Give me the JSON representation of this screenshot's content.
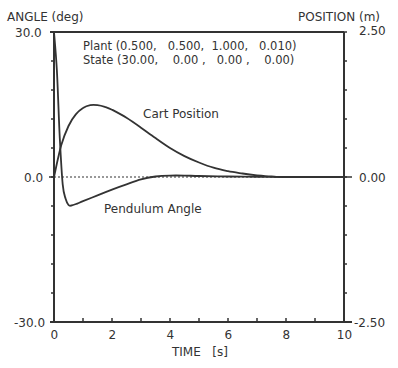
{
  "chart_data": {
    "type": "line",
    "title": "",
    "annotations": {
      "plant": "Plant (0.500,   0.500,  1.000,   0.010)",
      "state": "State (30.00,    0.00 ,   0.00 ,    0.00)"
    },
    "xlabel": "TIME   [s]",
    "ylabel_left": "ANGLE (deg)",
    "ylabel_right": "POSITION (m)",
    "xlim": [
      0,
      10
    ],
    "ylim_left": [
      -30.0,
      30.0
    ],
    "ylim_right": [
      -2.5,
      2.5
    ],
    "x_ticks": [
      "0",
      "2",
      "4",
      "6",
      "8",
      "10"
    ],
    "y_left_ticks": [
      "30.0",
      "0.0",
      "-30.0"
    ],
    "y_right_ticks": [
      "2.50",
      "0.00",
      "-2.50"
    ],
    "grid": false,
    "zero_line": "dotted",
    "series": [
      {
        "name": "Cart Position",
        "axis": "right",
        "x": [
          0,
          0.25,
          0.5,
          0.75,
          1.0,
          1.25,
          1.5,
          1.75,
          2.0,
          2.5,
          3.0,
          3.5,
          4.0,
          4.5,
          5.0,
          5.5,
          6.0,
          6.5,
          7.0,
          7.5,
          8.0,
          10.0
        ],
        "values": [
          0.0,
          0.55,
          0.88,
          1.08,
          1.19,
          1.24,
          1.24,
          1.21,
          1.16,
          1.02,
          0.85,
          0.67,
          0.5,
          0.36,
          0.25,
          0.16,
          0.1,
          0.06,
          0.03,
          0.01,
          0.0,
          0.0
        ]
      },
      {
        "name": "Pendulum Angle",
        "axis": "left",
        "x": [
          0,
          0.1,
          0.2,
          0.3,
          0.4,
          0.5,
          0.6,
          0.8,
          1.0,
          1.5,
          2.0,
          2.5,
          3.0,
          3.5,
          4.0,
          4.5,
          5.0,
          6.0,
          7.0,
          8.0,
          10.0
        ],
        "values": [
          30.0,
          22.0,
          8.0,
          -1.5,
          -4.5,
          -5.8,
          -5.9,
          -5.5,
          -5.0,
          -3.8,
          -2.6,
          -1.5,
          -0.5,
          0.1,
          0.3,
          0.3,
          0.2,
          0.1,
          0.05,
          0.0,
          0.0
        ]
      }
    ],
    "series_labels": [
      "Cart Position",
      "Pendulum Angle"
    ]
  }
}
